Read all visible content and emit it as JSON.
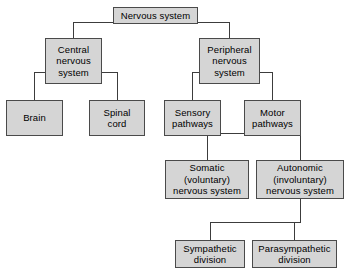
{
  "diagram": {
    "type": "hierarchy-tree",
    "canvas": {
      "width": 351,
      "height": 278
    },
    "style": {
      "box_fill": "#d5d5d5",
      "box_border": "#4a4a4a",
      "connector_color": "#3c3c3c",
      "text_color": "#000000",
      "background": "#ffffff"
    },
    "nodes": [
      {
        "id": "nervous-system",
        "label": "Nervous system",
        "lines": [
          "Nervous system"
        ],
        "level": 0,
        "x": 113,
        "y": 7,
        "w": 85,
        "h": 17
      },
      {
        "id": "central-nervous-system",
        "label": "Central nervous system",
        "lines": [
          "Central",
          "nervous",
          "system"
        ],
        "level": 1,
        "x": 45,
        "y": 38,
        "w": 57,
        "h": 46
      },
      {
        "id": "peripheral-nervous-system",
        "label": "Peripheral nervous system",
        "lines": [
          "Peripheral",
          "nervous",
          "system"
        ],
        "level": 1,
        "x": 199,
        "y": 38,
        "w": 61,
        "h": 46
      },
      {
        "id": "brain",
        "label": "Brain",
        "lines": [
          "Brain"
        ],
        "level": 2,
        "x": 6,
        "y": 100,
        "w": 57,
        "h": 36
      },
      {
        "id": "spinal-cord",
        "label": "Spinal cord",
        "lines": [
          "Spinal",
          "cord"
        ],
        "level": 2,
        "x": 89,
        "y": 100,
        "w": 56,
        "h": 36
      },
      {
        "id": "sensory-pathways",
        "label": "Sensory pathways",
        "lines": [
          "Sensory",
          "pathways"
        ],
        "level": 2,
        "x": 164,
        "y": 100,
        "w": 57,
        "h": 36
      },
      {
        "id": "motor-pathways",
        "label": "Motor pathways",
        "lines": [
          "Motor",
          "pathways"
        ],
        "level": 2,
        "x": 244,
        "y": 100,
        "w": 57,
        "h": 36
      },
      {
        "id": "somatic-nervous-system",
        "label": "Somatic (voluntary) nervous system",
        "lines": [
          "Somatic",
          "(voluntary)",
          "nervous system"
        ],
        "level": 3,
        "x": 165,
        "y": 160,
        "w": 84,
        "h": 39
      },
      {
        "id": "autonomic-nervous-system",
        "label": "Autonomic (involuntary) nervous system",
        "lines": [
          "Autonomic",
          "(involuntary)",
          "nervous system"
        ],
        "level": 3,
        "x": 256,
        "y": 160,
        "w": 88,
        "h": 39
      },
      {
        "id": "sympathetic-division",
        "label": "Sympathetic division",
        "lines": [
          "Sympathetic",
          "division"
        ],
        "level": 4,
        "x": 175,
        "y": 240,
        "w": 70,
        "h": 28
      },
      {
        "id": "parasympathetic-division",
        "label": "Parasympathetic division",
        "lines": [
          "Parasympathetic",
          "division"
        ],
        "level": 4,
        "x": 252,
        "y": 240,
        "w": 85,
        "h": 28
      }
    ],
    "edges": [
      {
        "from": "nervous-system",
        "to": "central-nervous-system"
      },
      {
        "from": "nervous-system",
        "to": "peripheral-nervous-system"
      },
      {
        "from": "central-nervous-system",
        "to": "brain"
      },
      {
        "from": "central-nervous-system",
        "to": "spinal-cord"
      },
      {
        "from": "peripheral-nervous-system",
        "to": "sensory-pathways"
      },
      {
        "from": "peripheral-nervous-system",
        "to": "motor-pathways"
      },
      {
        "from": "motor-pathways",
        "to": "somatic-nervous-system"
      },
      {
        "from": "motor-pathways",
        "to": "autonomic-nervous-system"
      },
      {
        "from": "autonomic-nervous-system",
        "to": "sympathetic-division"
      },
      {
        "from": "autonomic-nervous-system",
        "to": "parasympathetic-division"
      }
    ],
    "connectors": [
      {
        "id": "ns-stub-down",
        "orient": "v",
        "x": 155,
        "y": 24,
        "len": 0
      },
      {
        "id": "ns-busbar",
        "orient": "h",
        "x": 73,
        "y": 22,
        "len": 157
      },
      {
        "id": "ns-to-cns",
        "orient": "v",
        "x": 73,
        "y": 22,
        "len": 16
      },
      {
        "id": "ns-to-pns",
        "orient": "v",
        "x": 229,
        "y": 22,
        "len": 16
      },
      {
        "id": "cns-drop",
        "orient": "v",
        "x": 73,
        "y": 84,
        "len": 0
      },
      {
        "id": "cns-busbar",
        "orient": "h",
        "x": 34,
        "y": 72,
        "len": 84
      },
      {
        "id": "cns-left-stub",
        "orient": "v",
        "x": 45,
        "y": 72,
        "len": 0
      },
      {
        "id": "cns-to-brain",
        "orient": "v",
        "x": 34,
        "y": 72,
        "len": 28
      },
      {
        "id": "cns-to-spinal",
        "orient": "v",
        "x": 117,
        "y": 72,
        "len": 28
      },
      {
        "id": "pns-busbar",
        "orient": "h",
        "x": 192,
        "y": 72,
        "len": 81
      },
      {
        "id": "pns-to-sensory",
        "orient": "v",
        "x": 192,
        "y": 72,
        "len": 28
      },
      {
        "id": "pns-to-motor",
        "orient": "v",
        "x": 272,
        "y": 72,
        "len": 28
      },
      {
        "id": "motor-busbar",
        "orient": "h",
        "x": 207,
        "y": 133,
        "len": 94
      },
      {
        "id": "motor-drop",
        "orient": "v",
        "x": 272,
        "y": 136,
        "len": 0
      },
      {
        "id": "motor-to-somatic",
        "orient": "v",
        "x": 207,
        "y": 133,
        "len": 27
      },
      {
        "id": "motor-to-autonomic",
        "orient": "v",
        "x": 300,
        "y": 133,
        "len": 27
      },
      {
        "id": "auto-drop",
        "orient": "v",
        "x": 300,
        "y": 199,
        "len": 23
      },
      {
        "id": "auto-busbar",
        "orient": "h",
        "x": 210,
        "y": 222,
        "len": 91
      },
      {
        "id": "auto-to-symp",
        "orient": "v",
        "x": 210,
        "y": 222,
        "len": 18
      },
      {
        "id": "auto-to-parasymp",
        "orient": "v",
        "x": 294,
        "y": 222,
        "len": 18
      }
    ]
  }
}
